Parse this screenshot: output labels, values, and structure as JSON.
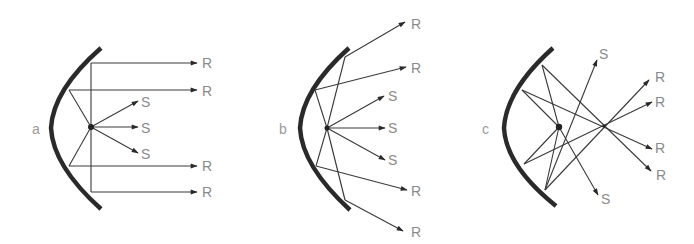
{
  "figure": {
    "colors": {
      "mirror": "#2a2a2a",
      "ray": "#3a3a3a",
      "label": "#8a8a8a"
    },
    "panels": [
      {
        "id": "a",
        "label": "a",
        "case": "source at focus — reflected rays parallel",
        "reflected_labels": [
          "R",
          "R",
          "R",
          "R"
        ],
        "direct_labels": [
          "S",
          "S",
          "S"
        ]
      },
      {
        "id": "b",
        "label": "b",
        "case": "source inside focus — reflected rays diverge",
        "reflected_labels": [
          "R",
          "R",
          "R",
          "R"
        ],
        "direct_labels": [
          "S",
          "S",
          "S"
        ]
      },
      {
        "id": "c",
        "label": "c",
        "case": "source outside focus — reflected rays converge then cross",
        "reflected_labels": [
          "R",
          "R",
          "R",
          "R"
        ],
        "direct_labels": [
          "S",
          "S"
        ]
      }
    ]
  }
}
